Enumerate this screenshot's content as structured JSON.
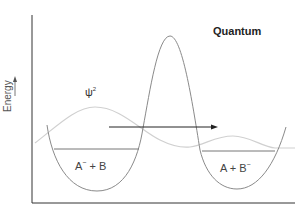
{
  "diagram": {
    "title": "Quantum",
    "y_axis_label": "Energy",
    "wavefunction_label": "ψ",
    "wavefunction_exponent": "2",
    "left_state": {
      "a": "A",
      "a_sup": "−",
      "plus": " + B",
      "b_sup": ""
    },
    "right_state": {
      "a": "A + B",
      "b_sup": "−"
    },
    "colors": {
      "axis": "#333333",
      "potential": "#8a8a8a",
      "wavefunction": "#cfcfcf",
      "energy_level": "#777777",
      "arrow": "#222222"
    }
  }
}
